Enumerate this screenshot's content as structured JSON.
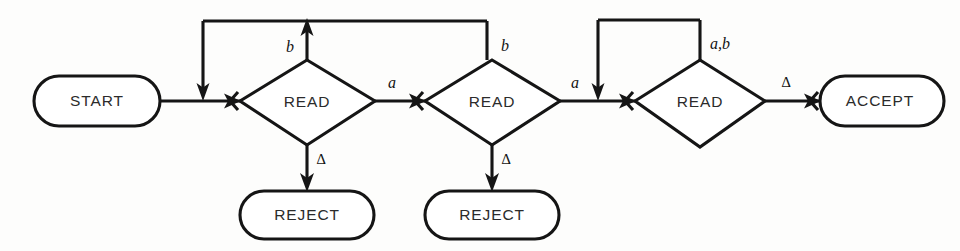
{
  "diagram": {
    "type": "flowchart",
    "background_color": "#fdfdfc",
    "line_color": "#151515",
    "text_color": "#2b2b2b",
    "nodes": [
      {
        "id": "start",
        "label": "START",
        "shape": "stadium",
        "cx": 97,
        "cy": 101
      },
      {
        "id": "read1",
        "label": "READ",
        "shape": "diamond",
        "cx": 307,
        "cy": 102
      },
      {
        "id": "read2",
        "label": "READ",
        "shape": "diamond",
        "cx": 492,
        "cy": 102
      },
      {
        "id": "read3",
        "label": "READ",
        "shape": "diamond",
        "cx": 700,
        "cy": 102
      },
      {
        "id": "reject1",
        "label": "REJECT",
        "shape": "stadium",
        "cx": 307,
        "cy": 215
      },
      {
        "id": "reject2",
        "label": "REJECT",
        "shape": "stadium",
        "cx": 492,
        "cy": 215
      },
      {
        "id": "accept",
        "label": "ACCEPT",
        "shape": "stadium",
        "cx": 879,
        "cy": 101
      }
    ],
    "edge_labels": [
      {
        "id": "read1-b",
        "text": "b",
        "x": 290,
        "y": 48
      },
      {
        "id": "read1-a",
        "text": "a",
        "x": 392,
        "y": 84
      },
      {
        "id": "read1-blank",
        "text": "∆",
        "x": 321,
        "y": 160
      },
      {
        "id": "read2-b",
        "text": "b",
        "x": 505,
        "y": 47
      },
      {
        "id": "read2-a",
        "text": "a",
        "x": 575,
        "y": 84
      },
      {
        "id": "read2-blank",
        "text": "∆",
        "x": 506,
        "y": 160
      },
      {
        "id": "read3-ab",
        "text": "a,b",
        "x": 718,
        "y": 45
      },
      {
        "id": "read3-blank",
        "text": "∆",
        "x": 785,
        "y": 84
      }
    ],
    "edges": [
      {
        "from": "start",
        "to": "read1",
        "label": ""
      },
      {
        "from": "read1",
        "to": "read1",
        "label": "b"
      },
      {
        "from": "read1",
        "to": "read2",
        "label": "a"
      },
      {
        "from": "read1",
        "to": "reject1",
        "label": "∆"
      },
      {
        "from": "read2",
        "to": "read1",
        "label": "b"
      },
      {
        "from": "read2",
        "to": "read3",
        "label": "a"
      },
      {
        "from": "read2",
        "to": "reject2",
        "label": "∆"
      },
      {
        "from": "read3",
        "to": "read3",
        "label": "a,b"
      },
      {
        "from": "read3",
        "to": "accept",
        "label": "∆"
      }
    ]
  }
}
